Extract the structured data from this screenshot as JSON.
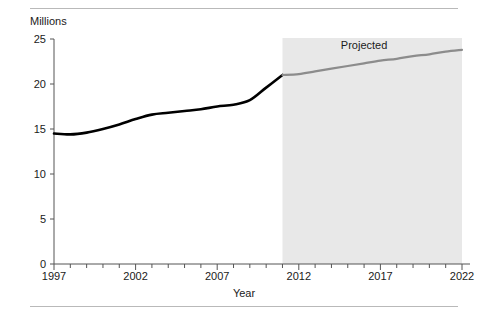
{
  "chart_data": {
    "type": "line",
    "title": "",
    "xlabel": "Year",
    "ylabel": "Millions",
    "ylim": [
      0,
      25
    ],
    "xlim": [
      1997,
      2022
    ],
    "yticks": [
      0,
      5,
      10,
      15,
      20,
      25
    ],
    "ytick_labels": [
      "0",
      "5",
      "10",
      "15",
      "20",
      "25"
    ],
    "xticks": [
      1997,
      2002,
      2007,
      2012,
      2017,
      2022
    ],
    "xtick_labels": [
      "1997",
      "2002",
      "2007",
      "2012",
      "2017",
      "2022"
    ],
    "minor_xtick_interval": 1,
    "grid": false,
    "legend": "none",
    "annotations": [
      {
        "text": "Projected",
        "x": 2016,
        "y": 24.2
      }
    ],
    "shaded_regions": [
      {
        "label": "Projected",
        "x_start": 2011,
        "x_end": 2022,
        "color": "#e8e8e8"
      }
    ],
    "series": [
      {
        "name": "Actual",
        "color": "#000000",
        "x": [
          1997,
          1998,
          1999,
          2000,
          2001,
          2002,
          2003,
          2004,
          2005,
          2006,
          2007,
          2008,
          2009,
          2010,
          2011
        ],
        "values": [
          14.5,
          14.4,
          14.6,
          15.0,
          15.5,
          16.1,
          16.6,
          16.8,
          17.0,
          17.2,
          17.5,
          17.7,
          18.2,
          19.6,
          21.0
        ]
      },
      {
        "name": "Projected",
        "color": "#8c8c8c",
        "x": [
          2011,
          2012,
          2013,
          2014,
          2015,
          2016,
          2017,
          2018,
          2019,
          2020,
          2021,
          2022
        ],
        "values": [
          21.0,
          21.1,
          21.4,
          21.7,
          22.0,
          22.3,
          22.6,
          22.8,
          23.1,
          23.3,
          23.6,
          23.8
        ]
      }
    ]
  },
  "colors": {
    "actual_line": "#000000",
    "projected_line": "#8c8c8c",
    "shaded_band": "#e8e8e8",
    "axis": "#555555",
    "rule": "#b9b9b9",
    "text": "#1a1a1a"
  }
}
